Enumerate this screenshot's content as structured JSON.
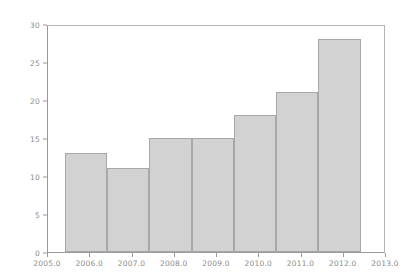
{
  "chart_data": {
    "type": "bar",
    "title": "",
    "subtitle": "",
    "xlabel": "",
    "ylabel": "",
    "categories": [
      "2006",
      "2007",
      "2008",
      "2009",
      "2010",
      "2011",
      "2012"
    ],
    "values": [
      13,
      11,
      15,
      15,
      18,
      21,
      28
    ],
    "bar_left_edges": [
      2005.4,
      2006.4,
      2007.4,
      2008.4,
      2009.4,
      2010.4,
      2011.4
    ],
    "bar_width": 1.0,
    "xlim": [
      2005.0,
      2013.0
    ],
    "ylim": [
      0,
      30
    ],
    "x_ticks": [
      "2005.0",
      "2006.0",
      "2007.0",
      "2008.0",
      "2009.0",
      "2010.0",
      "2011.0",
      "2012.0",
      "2013.0"
    ],
    "x_tick_values": [
      2005.0,
      2006.0,
      2007.0,
      2008.0,
      2009.0,
      2010.0,
      2011.0,
      2012.0,
      2013.0
    ],
    "y_ticks": [
      "0",
      "5",
      "10",
      "15",
      "20",
      "25",
      "30"
    ],
    "y_tick_values": [
      0,
      5,
      10,
      15,
      20,
      25,
      30
    ],
    "grid": false,
    "legend": null,
    "legend_position": "none",
    "colors": {
      "bar_fill": "#d2d2d2",
      "bar_edge": "#a8a8a8",
      "axis": "#9a9a9a",
      "tick_label": "#8c8c8c",
      "background": "#ffffff"
    }
  }
}
